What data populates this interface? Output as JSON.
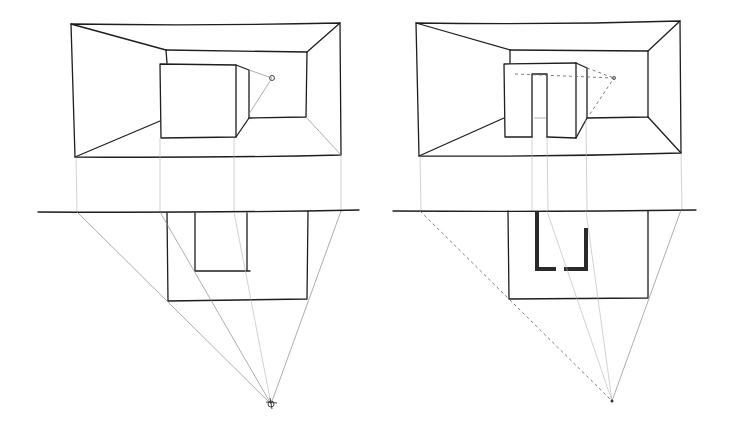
{
  "figure": {
    "colors": {
      "ink": "#1e1e1e",
      "construction": "#8a8a8a",
      "background": "#ffffff"
    }
  },
  "drawings": [
    {
      "id": "left",
      "elements": [
        "room-perspective",
        "cube-object",
        "vanishing-point",
        "picture-plane-line",
        "plan-view",
        "station-point"
      ]
    },
    {
      "id": "right",
      "elements": [
        "room-perspective",
        "block-with-door-opening",
        "vanishing-point",
        "picture-plane-line",
        "plan-view-with-u-notch",
        "station-point"
      ]
    }
  ]
}
